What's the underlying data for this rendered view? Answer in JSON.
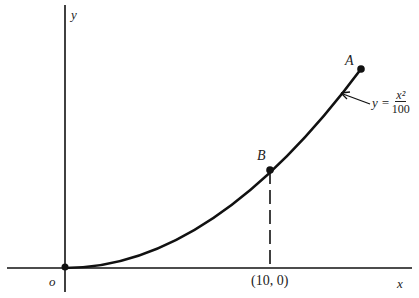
{
  "diagram": {
    "type": "parabola-plot",
    "axes": {
      "x_label": "x",
      "y_label": "y",
      "origin_label": "o"
    },
    "curve": {
      "equation_lhs": "y =",
      "numerator": "x²",
      "denominator": "100"
    },
    "points": [
      {
        "id": "A",
        "label": "A"
      },
      {
        "id": "B",
        "label": "B"
      }
    ],
    "tick_label": "(10, 0)",
    "colors": {
      "ink": "#111111",
      "background": "#ffffff"
    }
  }
}
